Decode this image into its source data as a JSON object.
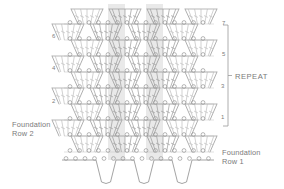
{
  "diagram": {
    "kind": "crochet-stitch-chart",
    "title": "",
    "background": "#ffffff",
    "stroke_color": "#9a9a9a",
    "stroke_color_light": "#bdbdbd",
    "shade_color": "#d7d7d7",
    "text_color": "#7a7a7a"
  },
  "labels": {
    "foundation_row_2": "Foundation\nRow 2",
    "foundation_row_1": "Foundation\nRow 1",
    "repeat": "REPEAT"
  },
  "row_numbers": {
    "right": [
      {
        "label": "7",
        "x": 222,
        "y": 20
      },
      {
        "label": "5",
        "x": 222,
        "y": 51
      },
      {
        "label": "3",
        "x": 221,
        "y": 83
      },
      {
        "label": "1",
        "x": 221,
        "y": 114
      }
    ],
    "left": [
      {
        "label": "6",
        "x": 52,
        "y": 33
      },
      {
        "label": "4",
        "x": 52,
        "y": 65
      },
      {
        "label": "2",
        "x": 52,
        "y": 98
      }
    ]
  },
  "repeat_bracket": {
    "x": 228,
    "top": 25,
    "bottom": 126,
    "tick": 5
  },
  "structure": {
    "motif_columns": 4,
    "motif_x_centers": [
      87,
      125,
      163,
      201
    ],
    "motif_half_top": 16,
    "motif_half_bottom": 9,
    "row_y": [
      152,
      136,
      120,
      104,
      88,
      72,
      56,
      40,
      24,
      9
    ],
    "row_count": 9,
    "shaded_bands": [
      {
        "x": 108,
        "width": 17
      },
      {
        "x": 146,
        "width": 17
      }
    ],
    "baseline_y": 160,
    "dip_centers": [
      106,
      144,
      182
    ],
    "dip_half_width": 10,
    "dip_depth": 22,
    "stitches_per_motif": 5,
    "chain_circle_radius": 1.9
  }
}
